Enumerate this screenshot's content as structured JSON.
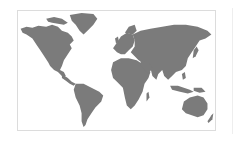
{
  "map": {
    "type": "world-map",
    "projection": "equirectangular",
    "land_color": "#7b7b7b",
    "water_color": "#ffffff",
    "border_color": "#dcdcdc",
    "regions": [
      {
        "id": "north-america",
        "label": "North America"
      },
      {
        "id": "greenland",
        "label": "Greenland"
      },
      {
        "id": "south-america",
        "label": "South America"
      },
      {
        "id": "europe",
        "label": "Europe"
      },
      {
        "id": "africa",
        "label": "Africa"
      },
      {
        "id": "asia",
        "label": "Asia"
      },
      {
        "id": "australia",
        "label": "Australia"
      }
    ]
  }
}
